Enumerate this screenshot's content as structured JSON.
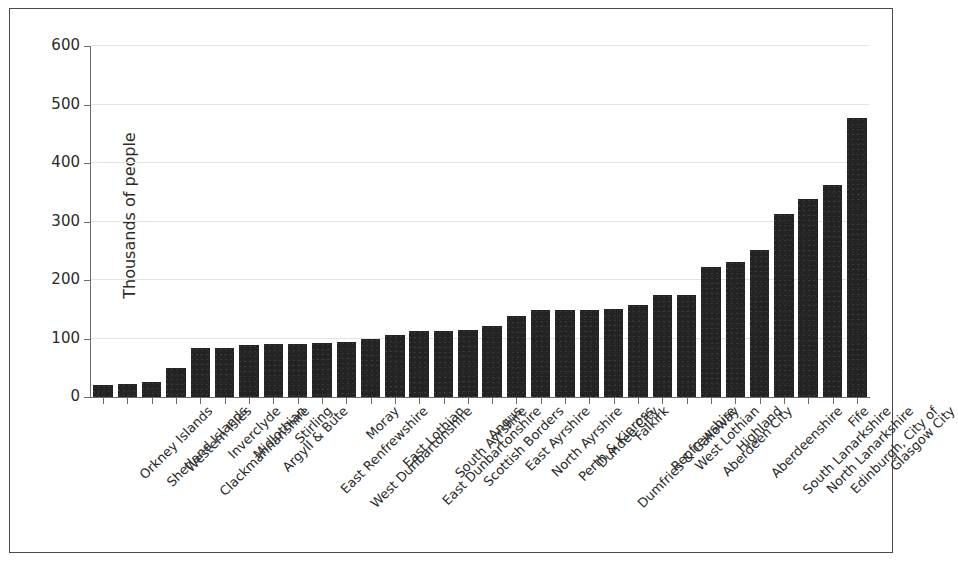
{
  "chart_data": {
    "type": "bar",
    "title": "",
    "subtitle": "",
    "xlabel": "",
    "ylabel": "Thousands of people",
    "ylim": [
      0,
      600
    ],
    "yticks": [
      0,
      100,
      200,
      300,
      400,
      500,
      600
    ],
    "ytick_labels": [
      "0",
      "100",
      "200",
      "300",
      "400",
      "500",
      "600"
    ],
    "grid": true,
    "grid_axis": "y",
    "legend": null,
    "legend_position": "none",
    "bar_color": "#232323",
    "background_color": "#ffffff",
    "axis_color": "#6b6b6b",
    "categories": [
      "Orkney Islands",
      "Shetland Islands",
      "Western Isles",
      "Clackmannanshire",
      "Inverclyde",
      "Midlothian",
      "Argyll & Bute",
      "Stirling",
      "East Renfrewshire",
      "West Dunbartonshire",
      "Moray",
      "East Lothian",
      "East Dunbartonshire",
      "South Ayrshire",
      "Scottish Borders",
      "Angus",
      "East Ayrshire",
      "North Ayrshire",
      "Perth & Kinross",
      "Dundee City",
      "Dumfries & Galloway",
      "Falkirk",
      "Renfrewshire",
      "West Lothian",
      "Aberdeen City",
      "Highland",
      "Aberdeenshire",
      "South Lanarkshire",
      "North Lanarkshire",
      "Edinburgh, City of",
      "Fife",
      "Glasgow City"
    ],
    "values": [
      20,
      22,
      26,
      49,
      83,
      84,
      89,
      90,
      91,
      92,
      94,
      99,
      106,
      112,
      113,
      115,
      122,
      138,
      148,
      148,
      148,
      151,
      157,
      175,
      175,
      222,
      231,
      252,
      313,
      338,
      363,
      477
    ],
    "values_note": "Glasgow City bar extends to approximately 590"
  },
  "axis": {
    "ylabel": "Thousands of people"
  }
}
